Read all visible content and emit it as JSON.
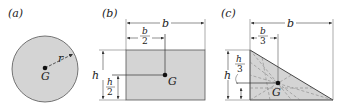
{
  "figures": [
    {
      "id": "a",
      "label": "(a)",
      "shape": "circle",
      "centroid_label": "G",
      "radius_label": "r"
    },
    {
      "id": "b",
      "label": "(b)",
      "shape": "rectangle",
      "centroid_label": "G",
      "width_label": "b",
      "height_label": "h",
      "half_width": {
        "num": "b",
        "den": "2"
      },
      "half_height": {
        "num": "h",
        "den": "2"
      }
    },
    {
      "id": "c",
      "label": "(c)",
      "shape": "right-triangle",
      "centroid_label": "G",
      "width_label": "b",
      "height_label": "h",
      "third_width": {
        "num": "b",
        "den": "3"
      },
      "third_height": {
        "num": "h",
        "den": "3"
      }
    }
  ],
  "colors": {
    "fill": "#d4d4d4",
    "stroke": "#333333",
    "dim": "#444444",
    "text": "#222222"
  }
}
